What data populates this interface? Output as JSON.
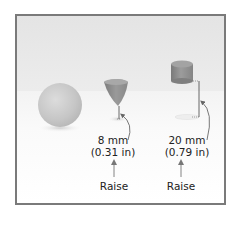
{
  "figure": {
    "frame_color": "#7a7a7a",
    "objects": [
      {
        "name": "sphere",
        "color": "#c9c9c9"
      },
      {
        "name": "cone",
        "color": "#8f8f8f"
      },
      {
        "name": "cylinder",
        "color": "#8a8a8a"
      }
    ],
    "measurements": [
      {
        "mm": "8 mm",
        "inches": "(0.31 in)",
        "action": "Raise"
      },
      {
        "mm": "20 mm",
        "inches": "(0.79 in)",
        "action": "Raise"
      }
    ]
  }
}
